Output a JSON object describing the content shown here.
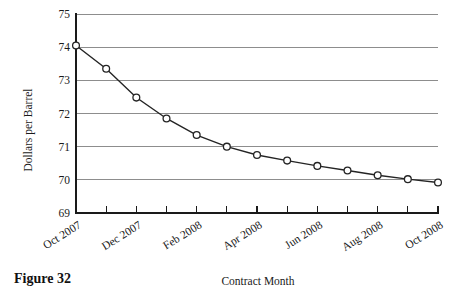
{
  "figure": {
    "caption": "Figure 32"
  },
  "chart_data": {
    "type": "line",
    "title": "",
    "xlabel": "Contract Month",
    "ylabel": "Dollars per Barrel",
    "ylim": [
      69,
      75
    ],
    "yticks": [
      69,
      70,
      71,
      72,
      73,
      74,
      75
    ],
    "grid": true,
    "legend": "none",
    "categories": [
      "Oct 2007",
      "Nov 2007",
      "Dec 2007",
      "Jan 2008",
      "Feb 2008",
      "Mar 2008",
      "Apr 2008",
      "May 2008",
      "Jun 2008",
      "Jul 2008",
      "Aug 2008",
      "Sep 2008",
      "Oct 2008"
    ],
    "xtick_labels": [
      "Oct 2007",
      "",
      "Dec 2007",
      "",
      "Feb 2008",
      "",
      "Apr 2008",
      "",
      "Jun 2008",
      "",
      "Aug 2008",
      "",
      "Oct 2008"
    ],
    "values": [
      74.05,
      73.35,
      72.48,
      71.85,
      71.35,
      71.0,
      70.75,
      70.58,
      70.42,
      70.28,
      70.14,
      70.02,
      69.92
    ],
    "marker": "circle-open",
    "line_color": "#242424",
    "marker_fill": "#ffffff",
    "grid_color": "#8d8d8d"
  }
}
